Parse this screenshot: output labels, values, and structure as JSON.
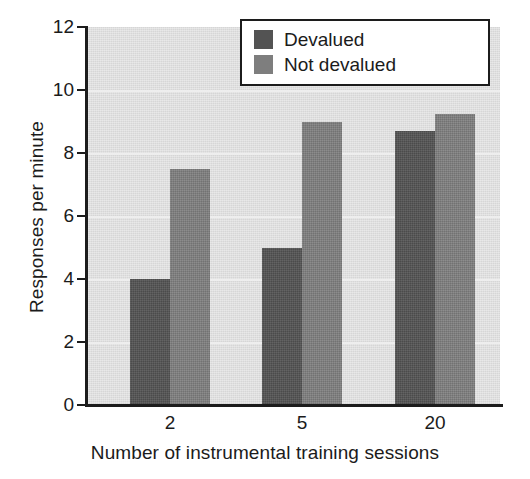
{
  "chart_data": {
    "type": "bar",
    "title": "",
    "subtitle": "",
    "xlabel": "Number of instrumental training sessions",
    "ylabel": "Responses per minute",
    "categories": [
      "2",
      "5",
      "20"
    ],
    "series": [
      {
        "name": "Devalued",
        "color": "#535353",
        "values": [
          4.0,
          5.0,
          8.7
        ]
      },
      {
        "name": "Not devalued",
        "color": "#7e7e7e",
        "values": [
          7.5,
          9.0,
          9.25
        ]
      }
    ],
    "ylim": [
      0,
      12
    ],
    "yticks": [
      0,
      2,
      4,
      6,
      8,
      10,
      12
    ],
    "ytick_labels": [
      "0",
      "2",
      "4",
      "6",
      "8",
      "10",
      "12"
    ],
    "grid": true,
    "grid_axis": "y",
    "gridline_color": "#eeeeee",
    "legend_position": "top-right",
    "plot_background": "#d6d6d6",
    "axis_color": "#1c1c1c",
    "figure_background": "#ffffff"
  },
  "legend": {
    "items": [
      {
        "label": "Devalued",
        "color": "#535353"
      },
      {
        "label": "Not devalued",
        "color": "#7e7e7e"
      }
    ]
  }
}
